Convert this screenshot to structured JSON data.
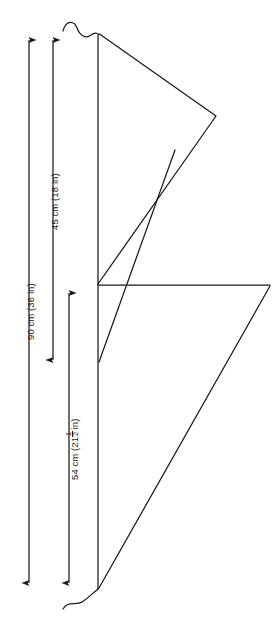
{
  "diagram": {
    "line_color": "#1a1a1a",
    "background": "#ffffff",
    "dimensions": [
      {
        "id": "overall-height",
        "label": "90 cm (36 in)",
        "value_cm": 90,
        "value_in": 36,
        "text_before_fraction": "90 cm (36 in)",
        "has_fraction": false
      },
      {
        "id": "upper-section",
        "label": "45 cm (18 in)",
        "value_cm": 45,
        "value_in": 18,
        "text_before_fraction": "45 cm (18 in)",
        "has_fraction": false
      },
      {
        "id": "lower-section",
        "label": "54 cm (21 1/2 in)",
        "value_cm": 54,
        "value_in": 21.5,
        "text_before_fraction": "54 cm (21",
        "fraction_numerator": "1",
        "fraction_denominator": "2",
        "text_after_fraction": "in)",
        "has_fraction": true
      }
    ],
    "break_symbols": {
      "top": "wavy-break-line",
      "bottom": "wavy-break-line"
    },
    "shapes": {
      "pole": "vertical-mast-line",
      "upper_triangle": "upper-sail-triangle",
      "lower_triangle": "lower-sail-triangle",
      "crossbar": "horizontal-spar-line"
    }
  }
}
